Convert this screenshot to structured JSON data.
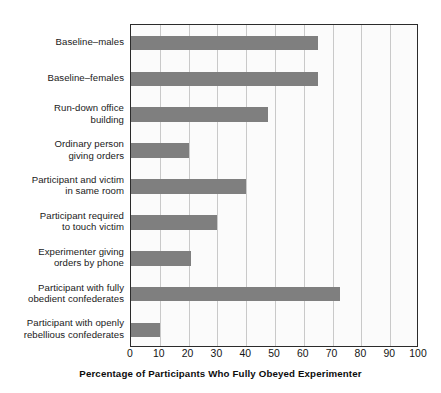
{
  "chart_data": {
    "type": "bar",
    "orientation": "horizontal",
    "title": "",
    "xlabel": "Percentage of Participants Who Fully Obeyed Experimenter",
    "ylabel": "",
    "xlim": [
      0,
      100
    ],
    "xticks": [
      "0",
      "10",
      "20",
      "30",
      "40",
      "50",
      "60",
      "70",
      "80",
      "90",
      "100"
    ],
    "grid": "vertical",
    "legend": "none",
    "bar_color": "#7f7f7f",
    "plot_background": "#fbfbfb",
    "gridline_color": "#c9c9c9",
    "axis_color": "#2b2b2b",
    "categories": [
      "Baseline–males",
      "Baseline–females",
      "Run-down office\nbuilding",
      "Ordinary person\ngiving orders",
      "Participant and victim\nin same room",
      "Participant required\nto touch victim",
      "Experimenter giving\norders by phone",
      "Participant with fully\nobedient confederates",
      "Participant with openly\nrebellious confederates"
    ],
    "values": [
      65,
      65,
      47.5,
      20,
      40,
      30,
      21,
      72.5,
      10
    ]
  }
}
